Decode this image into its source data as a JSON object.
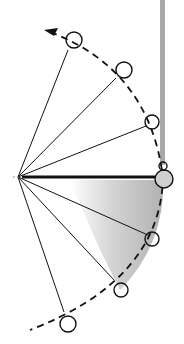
{
  "diagram": {
    "type": "pendulum-swing-sequence",
    "background": "#ffffff",
    "stroke_color": "#111111",
    "shade_color": "#bdbdbd",
    "wall_color": "#a8a8a8",
    "pivot": {
      "x": 18,
      "y": 177
    },
    "bobs": [
      {
        "x": 72,
        "y": 42
      },
      {
        "x": 122,
        "y": 70
      },
      {
        "x": 150,
        "y": 122
      },
      {
        "x": 163,
        "y": 178
      },
      {
        "x": 150,
        "y": 236
      },
      {
        "x": 120,
        "y": 288
      },
      {
        "x": 68,
        "y": 322
      }
    ],
    "arrow": {
      "label": "direction-of-swing"
    }
  }
}
